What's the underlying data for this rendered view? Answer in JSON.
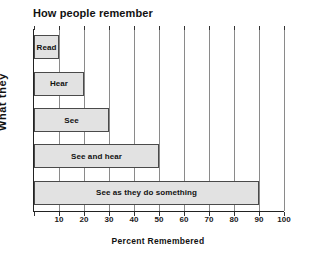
{
  "chart_data": {
    "type": "bar",
    "orientation": "horizontal",
    "title": "How people remember",
    "xlabel": "Percent  Remembered",
    "ylabel": "What  they",
    "categories": [
      "Read",
      "Hear",
      "See",
      "See and hear",
      "See as they do something"
    ],
    "values": [
      10,
      20,
      30,
      50,
      90
    ],
    "xlim": [
      0,
      100
    ],
    "xticks": [
      0,
      10,
      20,
      30,
      40,
      50,
      60,
      70,
      80,
      90,
      100
    ],
    "xtick_labels": [
      "",
      "10",
      "20",
      "30",
      "40",
      "50",
      "60",
      "70",
      "80",
      "90",
      "100"
    ],
    "grid": true,
    "grid_axis": "x",
    "legend": false,
    "bar_fill_color": "#e2e2e2",
    "bar_border_color": "#4a4a4a",
    "gridline_color": "#8a8a8a",
    "axis_color": "#222222",
    "background_color": "#ffffff"
  }
}
